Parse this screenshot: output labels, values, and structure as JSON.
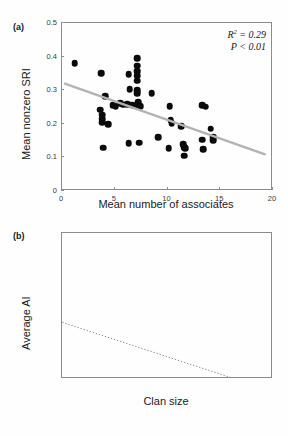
{
  "figure": {
    "panel_a_label": "(a)",
    "panel_b_label": "(b)"
  },
  "chart_data": [
    {
      "type": "scatter",
      "panel": "(a)",
      "title": "",
      "xlabel": "Mean number of associates",
      "ylabel": "Mean nonzero SRI",
      "xlim": [
        0,
        20
      ],
      "ylim": [
        0,
        0.5
      ],
      "xticks": [
        0,
        5,
        10,
        15,
        20
      ],
      "yticks": [
        0,
        0.1,
        0.2,
        0.3,
        0.4,
        0.5
      ],
      "xticklabels": [
        "0",
        "5",
        "10",
        "15",
        "20"
      ],
      "yticklabels": [
        "0",
        "0.1",
        "0.2",
        "0.3",
        "0.4",
        "0.5"
      ],
      "grid": false,
      "legend": "none",
      "annotations": [
        "R2 = 0.29",
        "P < 0.01"
      ],
      "annotation_r2_label": "R",
      "annotation_r2_exp": "2",
      "annotation_r2_value": "= 0.29",
      "annotation_p": "P < 0.01",
      "trendline": {
        "style": "solid",
        "color": "#b3b3b3",
        "x": [
          0.3,
          19.4
        ],
        "y": [
          0.317,
          0.105
        ]
      },
      "points": [
        {
          "x": 1.3,
          "y": 0.378
        },
        {
          "x": 3.8,
          "y": 0.347
        },
        {
          "x": 4.2,
          "y": 0.279
        },
        {
          "x": 3.7,
          "y": 0.239
        },
        {
          "x": 3.9,
          "y": 0.224
        },
        {
          "x": 3.9,
          "y": 0.212
        },
        {
          "x": 3.9,
          "y": 0.201
        },
        {
          "x": 4.5,
          "y": 0.196
        },
        {
          "x": 4.0,
          "y": 0.126
        },
        {
          "x": 4.9,
          "y": 0.253
        },
        {
          "x": 5.2,
          "y": 0.25
        },
        {
          "x": 5.6,
          "y": 0.259
        },
        {
          "x": 5.9,
          "y": 0.254
        },
        {
          "x": 6.4,
          "y": 0.345
        },
        {
          "x": 6.5,
          "y": 0.3
        },
        {
          "x": 6.3,
          "y": 0.256
        },
        {
          "x": 6.6,
          "y": 0.254
        },
        {
          "x": 6.8,
          "y": 0.252
        },
        {
          "x": 6.4,
          "y": 0.139
        },
        {
          "x": 7.2,
          "y": 0.393
        },
        {
          "x": 7.2,
          "y": 0.37
        },
        {
          "x": 7.2,
          "y": 0.353
        },
        {
          "x": 7.2,
          "y": 0.34
        },
        {
          "x": 7.2,
          "y": 0.325
        },
        {
          "x": 7.2,
          "y": 0.297
        },
        {
          "x": 7.2,
          "y": 0.288
        },
        {
          "x": 7.3,
          "y": 0.262
        },
        {
          "x": 7.3,
          "y": 0.253
        },
        {
          "x": 7.5,
          "y": 0.249
        },
        {
          "x": 7.4,
          "y": 0.141
        },
        {
          "x": 8.6,
          "y": 0.288
        },
        {
          "x": 9.2,
          "y": 0.158
        },
        {
          "x": 10.3,
          "y": 0.249
        },
        {
          "x": 10.4,
          "y": 0.208
        },
        {
          "x": 10.5,
          "y": 0.199
        },
        {
          "x": 10.2,
          "y": 0.124
        },
        {
          "x": 11.4,
          "y": 0.19
        },
        {
          "x": 11.6,
          "y": 0.136
        },
        {
          "x": 11.7,
          "y": 0.128
        },
        {
          "x": 11.8,
          "y": 0.125
        },
        {
          "x": 11.7,
          "y": 0.102
        },
        {
          "x": 13.4,
          "y": 0.253
        },
        {
          "x": 13.7,
          "y": 0.248
        },
        {
          "x": 13.4,
          "y": 0.15
        },
        {
          "x": 13.5,
          "y": 0.122
        },
        {
          "x": 14.2,
          "y": 0.182
        },
        {
          "x": 14.4,
          "y": 0.158
        },
        {
          "x": 14.4,
          "y": 0.148
        }
      ]
    },
    {
      "type": "scatter",
      "panel": "(b)",
      "title": "",
      "xlabel": "Clan size",
      "ylabel": "Average AI",
      "xlim": [
        0,
        35
      ],
      "ylim": [
        0,
        0.8
      ],
      "xticks": [
        0,
        5,
        10,
        15,
        20,
        25,
        30,
        35
      ],
      "yticks": [
        0,
        0.2,
        0.4,
        0.6,
        0.8
      ],
      "xticklabels": [
        "0",
        "5",
        "10",
        "15",
        "20",
        "25",
        "30",
        "35"
      ],
      "yticklabels": [
        "0",
        "0.2",
        "0.4",
        "0.6",
        "0.8"
      ],
      "grid": false,
      "legend": "none",
      "trendline": {
        "style": "dotted",
        "color": "#8c8c8c",
        "x": [
          0.2,
          28.4
        ],
        "y": [
          0.305,
          0.0
        ]
      },
      "points": [
        {
          "x": 4.3,
          "y": 0.53,
          "err_low": 0.355,
          "err_high": 0.715
        },
        {
          "x": 6.1,
          "y": 0.173,
          "err_low": 0.072,
          "err_high": 0.272
        },
        {
          "x": 7.1,
          "y": 0.255,
          "err_low": 0.155,
          "err_high": 0.352
        },
        {
          "x": 8.2,
          "y": 0.158,
          "err_low": 0.078,
          "err_high": 0.238
        },
        {
          "x": 9.2,
          "y": 0.118,
          "err_low": 0.05,
          "err_high": 0.192
        },
        {
          "x": 11.0,
          "y": 0.191,
          "err_low": 0.123,
          "err_high": 0.258
        },
        {
          "x": 12.0,
          "y": 0.14,
          "err_low": 0.07,
          "err_high": 0.21
        },
        {
          "x": 15.9,
          "y": 0.101,
          "err_low": 0.07,
          "err_high": 0.135
        },
        {
          "x": 16.2,
          "y": 0.092,
          "err_low": 0.066,
          "err_high": 0.12
        },
        {
          "x": 17.0,
          "y": 0.108,
          "err_low": 0.075,
          "err_high": 0.142
        },
        {
          "x": 20.0,
          "y": 0.08,
          "err_low": 0.052,
          "err_high": 0.112
        },
        {
          "x": 21.0,
          "y": 0.068,
          "err_low": 0.044,
          "err_high": 0.095
        },
        {
          "x": 21.1,
          "y": 0.058,
          "err_low": 0.04,
          "err_high": 0.08
        },
        {
          "x": 32.0,
          "y": 0.08,
          "err_low": 0.072,
          "err_high": 0.09
        }
      ]
    }
  ]
}
